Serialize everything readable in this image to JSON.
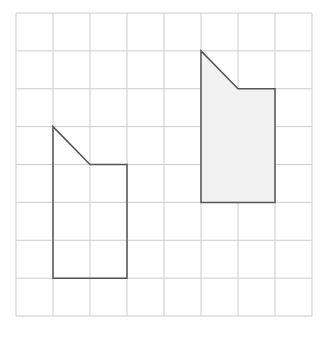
{
  "label": "",
  "grid": {
    "origin": [
      16,
      13
    ],
    "cols": 8,
    "rows": 8,
    "cell_w": 37,
    "cell_h": 37.875,
    "line_color": "#cccccc"
  },
  "shapes": [
    {
      "name": "original-shape",
      "points_grid": [
        [
          1,
          3
        ],
        [
          2,
          4
        ],
        [
          3,
          4
        ],
        [
          3,
          7
        ],
        [
          1,
          7
        ]
      ],
      "fill": "none",
      "stroke": "#555555"
    },
    {
      "name": "translated-shape",
      "points_grid": [
        [
          5,
          1
        ],
        [
          6,
          2
        ],
        [
          7,
          2
        ],
        [
          7,
          5
        ],
        [
          5,
          5
        ]
      ],
      "fill": "#f2f2f2",
      "stroke": "#555555"
    }
  ]
}
